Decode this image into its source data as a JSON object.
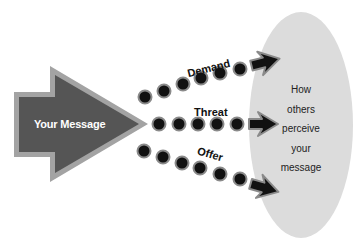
{
  "source": {
    "label": "Your Message"
  },
  "channels": [
    {
      "label": "Demand",
      "color": "#111111"
    },
    {
      "label": "Threat",
      "color": "#111111"
    },
    {
      "label": "Offer",
      "color": "#111111"
    }
  ],
  "target": {
    "lines": [
      "How",
      "others",
      "perceive",
      "your",
      "message"
    ]
  },
  "colors": {
    "arrow_fill": "#555555",
    "arrow_border": "#a3a3a3",
    "ellipse": "#dcdcdc",
    "dot_core": "#111111",
    "dot_ring": "#8a8a8a"
  }
}
